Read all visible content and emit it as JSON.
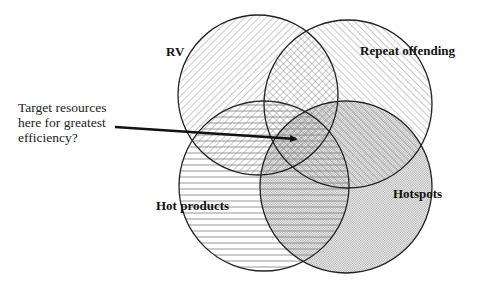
{
  "diagram": {
    "type": "venn",
    "sets": [
      {
        "id": "rv",
        "label": "RV",
        "pattern": "diagonal-down",
        "cx": 258,
        "cy": 95,
        "r": 80
      },
      {
        "id": "repeat",
        "label": "Repeat offending",
        "pattern": "diagonal-up",
        "cx": 348,
        "cy": 104,
        "r": 84
      },
      {
        "id": "hotproducts",
        "label": "Hot products",
        "pattern": "horizontal",
        "cx": 264,
        "cy": 186,
        "r": 85
      },
      {
        "id": "hotspots",
        "label": "Hotspots",
        "pattern": "dots",
        "cx": 346,
        "cy": 187,
        "r": 86
      }
    ],
    "annotation": {
      "lines": [
        "Target resources",
        "here for greatest",
        "efficiency?"
      ],
      "arrow_from": [
        115,
        127
      ],
      "arrow_to": [
        298,
        139
      ]
    }
  },
  "labels": {
    "rv": "RV",
    "repeat": "Repeat offending",
    "hotproducts": "Hot products",
    "hotspots": "Hotspots",
    "note_line1": "Target resources",
    "note_line2": "here for greatest",
    "note_line3": "efficiency?"
  },
  "colors": {
    "stroke": "#222222",
    "hatch": "#777777",
    "dots": "#9a9a9a",
    "text": "#111111"
  }
}
